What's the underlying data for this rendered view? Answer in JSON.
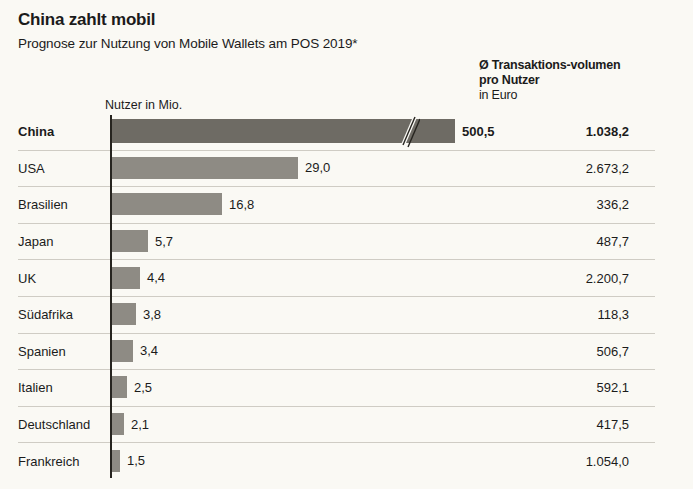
{
  "header": {
    "title": "China zahlt mobil",
    "subtitle": "Prognose zur Nutzung von Mobile Wallets am POS 2019*"
  },
  "columns": {
    "left_header": "Nutzer in Mio.",
    "right_header": "Ø Transaktions-volumen pro Nutzer",
    "right_header_unit": "in Euro"
  },
  "colors": {
    "background": "#faf9f4",
    "bar": "#8e8b84",
    "bar_highlight": "#6e6b64",
    "axis": "#26241f",
    "rule": "#cfccc4",
    "text": "#1b1b1b"
  },
  "chart_data": {
    "type": "bar",
    "title": "China zahlt mobil",
    "subtitle": "Prognose zur Nutzung von Mobile Wallets am POS 2019*",
    "orientation": "horizontal",
    "xlabel": "Nutzer in Mio.",
    "ylabel": "",
    "grid": false,
    "legend": "none",
    "axis_break": true,
    "axis_break_after": 40,
    "categories": [
      "China",
      "USA",
      "Brasilien",
      "Japan",
      "UK",
      "Südafrika",
      "Spanien",
      "Italien",
      "Deutschland",
      "Frankreich"
    ],
    "values": [
      500.5,
      29.0,
      16.8,
      5.7,
      4.4,
      3.8,
      3.4,
      2.5,
      2.1,
      1.5
    ],
    "value_labels": [
      "500,5",
      "29,0",
      "16,8",
      "5,7",
      "4,4",
      "3,8",
      "3,4",
      "2,5",
      "2,1",
      "1,5"
    ],
    "series": [
      {
        "name": "Nutzer in Mio.",
        "values": [
          500.5,
          29.0,
          16.8,
          5.7,
          4.4,
          3.8,
          3.4,
          2.5,
          2.1,
          1.5
        ]
      },
      {
        "name": "Ø Transaktionsvolumen pro Nutzer in Euro",
        "values": [
          1038.2,
          2673.2,
          336.2,
          487.7,
          2200.7,
          118.3,
          506.7,
          592.1,
          417.5,
          1054.0
        ]
      }
    ],
    "secondary_labels": [
      "1.038,2",
      "2.673,2",
      "336,2",
      "487,7",
      "2.200,7",
      "118,3",
      "506,7",
      "592,1",
      "417,5",
      "1.054,0"
    ]
  },
  "rows": [
    {
      "category": "China",
      "value_label": "500,5",
      "bar_px": 345,
      "right_label": "1.038,2",
      "highlight": true
    },
    {
      "category": "USA",
      "value_label": "29,0",
      "bar_px": 188,
      "right_label": "2.673,2",
      "highlight": false
    },
    {
      "category": "Brasilien",
      "value_label": "16,8",
      "bar_px": 112,
      "right_label": "336,2",
      "highlight": false
    },
    {
      "category": "Japan",
      "value_label": "5,7",
      "bar_px": 38,
      "right_label": "487,7",
      "highlight": false
    },
    {
      "category": "UK",
      "value_label": "4,4",
      "bar_px": 30,
      "right_label": "2.200,7",
      "highlight": false
    },
    {
      "category": "Südafrika",
      "value_label": "3,8",
      "bar_px": 26,
      "right_label": "118,3",
      "highlight": false
    },
    {
      "category": "Spanien",
      "value_label": "3,4",
      "bar_px": 23,
      "right_label": "506,7",
      "highlight": false
    },
    {
      "category": "Italien",
      "value_label": "2,5",
      "bar_px": 17,
      "right_label": "592,1",
      "highlight": false
    },
    {
      "category": "Deutschland",
      "value_label": "2,1",
      "bar_px": 14,
      "right_label": "417,5",
      "highlight": false
    },
    {
      "category": "Frankreich",
      "value_label": "1,5",
      "bar_px": 10,
      "right_label": "1.054,0",
      "highlight": false
    }
  ]
}
